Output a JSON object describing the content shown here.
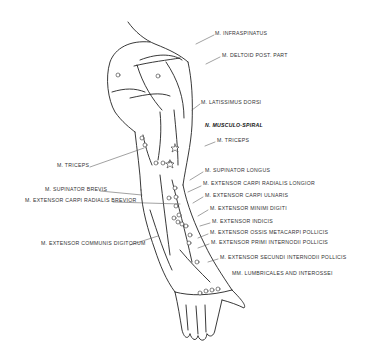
{
  "diagram": {
    "labels_right": [
      {
        "id": "infraspinatus",
        "text": "M. INFRASPINATUS",
        "x": 215,
        "y": 33
      },
      {
        "id": "deltoid",
        "text": "M. DELTOID POST. PART",
        "x": 222,
        "y": 55
      },
      {
        "id": "latissimus",
        "text": "M. LATISSIMUS DORSI",
        "x": 201,
        "y": 102
      },
      {
        "id": "musculo-spiral",
        "text": "N. MUSCULO-SPIRAL",
        "x": 205,
        "y": 125,
        "bold": true
      },
      {
        "id": "triceps-right",
        "text": "M. TRICEPS",
        "x": 217,
        "y": 140
      },
      {
        "id": "supinator-longus",
        "text": "M. SUPINATOR LONGUS",
        "x": 205,
        "y": 170
      },
      {
        "id": "ecr-longior",
        "text": "M. EXTENSOR CARPI RADIALIS LONGIOR",
        "x": 203,
        "y": 183
      },
      {
        "id": "ec-ulnaris",
        "text": "M. EXTENSOR CARPI ULNARIS",
        "x": 205,
        "y": 195
      },
      {
        "id": "em-digiti",
        "text": "M. EXTENSOR MINIMI DIGITI",
        "x": 210,
        "y": 208
      },
      {
        "id": "e-indicis",
        "text": "M. EXTENSOR INDICIS",
        "x": 212,
        "y": 221
      },
      {
        "id": "eom-pollicis",
        "text": "M. EXTENSOR OSSIS METACARPI POLLICIS",
        "x": 210,
        "y": 232
      },
      {
        "id": "epi-pollicis",
        "text": "M. EXTENSOR PRIMI INTERNODII POLLICIS",
        "x": 211,
        "y": 242
      },
      {
        "id": "esi-pollicis",
        "text": "M. EXTENSOR SECUNDI INTERNODII POLLICIS",
        "x": 220,
        "y": 257
      },
      {
        "id": "lumbricales",
        "text": "MM. LUMBRICALES AND INTEROSSEI",
        "x": 232,
        "y": 273
      }
    ],
    "labels_left": [
      {
        "id": "triceps-left",
        "text": "M. TRICEPS",
        "x": 57,
        "y": 165
      },
      {
        "id": "supinator-brevis",
        "text": "M. SUPINATOR BREVIS",
        "x": 45,
        "y": 189
      },
      {
        "id": "ecr-brevior",
        "text": "M. EXTENSOR CARPI RADIALIS BREVIOR",
        "x": 25,
        "y": 200
      },
      {
        "id": "ec-digitorum",
        "text": "M. EXTENSOR COMMUNIS DIGITORUM",
        "x": 41,
        "y": 243
      }
    ]
  }
}
